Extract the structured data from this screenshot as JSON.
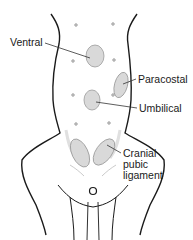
{
  "diagram": {
    "labels": {
      "ventral": "Ventral",
      "paracostal": "Paracostal",
      "umbilical": "Umbilical",
      "cranial_pubic_line1": "Cranial",
      "cranial_pubic_line2": "pubic",
      "cranial_pubic_line3": "ligament"
    },
    "colors": {
      "outline": "#1a1a1a",
      "hernia_fill": "#d9d9d9",
      "hernia_stroke": "#9a9a9a",
      "leader": "#333333"
    }
  }
}
